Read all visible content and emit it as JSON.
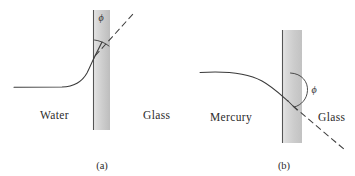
{
  "figure": {
    "background_color": "#ffffff",
    "ink_color": "#2b2b2b",
    "curve_color": "#3a3a3a",
    "glass_gradient_light": "#f2f2f2",
    "glass_gradient_dark": "#c0c0c0",
    "panels": [
      {
        "id": "a",
        "caption": "(a)",
        "liquid_label": "Water",
        "solid_label": "Glass",
        "angle_symbol": "ϕ",
        "angle_type": "acute",
        "meniscus_shape": "concave",
        "slab": {
          "x": 93,
          "y": 10,
          "width": 17,
          "height": 120
        },
        "liquid_label_pos": {
          "x": 40,
          "y": 118
        },
        "solid_label_pos": {
          "x": 143,
          "y": 118
        },
        "caption_pos": {
          "x": 95,
          "y": 169
        },
        "angle_symbol_pos": {
          "x": 101,
          "y": 20
        },
        "contact_point": {
          "x": 94,
          "y": 58
        },
        "flat_level_y": 87,
        "tangent_end": {
          "x": 133,
          "y": 14
        }
      },
      {
        "id": "b",
        "caption": "(b)",
        "liquid_label": "Mercury",
        "solid_label": "Glass",
        "angle_symbol": "ϕ",
        "angle_type": "obtuse",
        "meniscus_shape": "convex",
        "slab": {
          "x": 282,
          "y": 30,
          "width": 20,
          "height": 113
        },
        "liquid_label_pos": {
          "x": 210,
          "y": 120
        },
        "solid_label_pos": {
          "x": 318,
          "y": 120
        },
        "caption_pos": {
          "x": 277,
          "y": 169
        },
        "angle_symbol_pos": {
          "x": 310,
          "y": 93
        },
        "contact_point": {
          "x": 290,
          "y": 101
        },
        "flat_level_y": 72,
        "tangent_end": {
          "x": 345,
          "y": 150
        }
      }
    ]
  }
}
